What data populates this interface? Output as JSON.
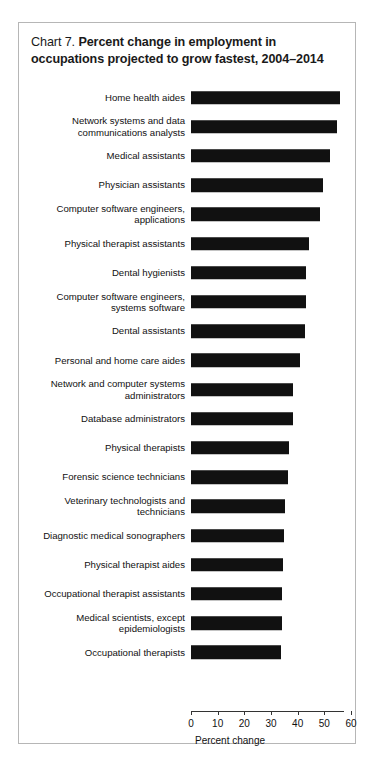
{
  "chart": {
    "label": "Chart 7.",
    "title_line1": "Percent change in employment in",
    "title_line2": "occupations projected to grow fastest, 2004–2014",
    "bar_color": "#111111",
    "border_color": "#b6b6b6"
  },
  "chart_data": {
    "type": "bar",
    "orientation": "horizontal",
    "title": "Chart 7. Percent change in employment in occupations projected to grow fastest, 2004–2014",
    "xlabel": "Percent change",
    "ylabel": "",
    "xlim": [
      0,
      60
    ],
    "xticks": [
      0,
      10,
      20,
      30,
      40,
      50,
      60
    ],
    "xtick_labels": [
      "0",
      "10",
      "20",
      "30",
      "40",
      "50",
      "60"
    ],
    "grid": false,
    "legend": null,
    "categories": [
      "Home health aides",
      "Network systems and data\ncommunications analysts",
      "Medical assistants",
      "Physician assistants",
      "Computer software engineers,\napplications",
      "Physical therapist assistants",
      "Dental hygienists",
      "Computer software engineers,\nsystems software",
      "Dental assistants",
      "Personal and home care aides",
      "Network and computer systems\nadministrators",
      "Database administrators",
      "Physical therapists",
      "Forensic science technicians",
      "Veterinary technologists and\ntechnicians",
      "Diagnostic medical sonographers",
      "Physical therapist aides",
      "Occupational therapist assistants",
      "Medical scientists, except\nepidemiologists",
      "Occupational therapists"
    ],
    "values": [
      56.0,
      54.6,
      52.1,
      49.6,
      48.4,
      44.2,
      43.3,
      43.0,
      42.7,
      41.0,
      38.4,
      38.2,
      36.7,
      36.4,
      35.3,
      34.8,
      34.4,
      34.1,
      34.1,
      33.6
    ]
  }
}
